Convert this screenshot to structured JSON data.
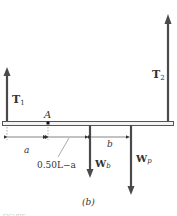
{
  "figure": {
    "caption": "(b)",
    "footer_text": "FIGURE"
  },
  "forces": {
    "T1": {
      "label": "T",
      "sub": "1",
      "direction": "up"
    },
    "T2": {
      "label": "T",
      "sub": "2",
      "direction": "up"
    },
    "Wb": {
      "label": "W",
      "sub": "b",
      "direction": "down"
    },
    "Wp": {
      "label": "W",
      "sub": "p",
      "direction": "down"
    }
  },
  "points": {
    "A": "A"
  },
  "dimensions": {
    "a": "a",
    "mid": "0.50L−a",
    "b": "b"
  },
  "colors": {
    "arrow": "#4a4a4a",
    "beam_fill": "#f4f4f4",
    "beam_stroke": "#555555",
    "text": "#333333"
  }
}
